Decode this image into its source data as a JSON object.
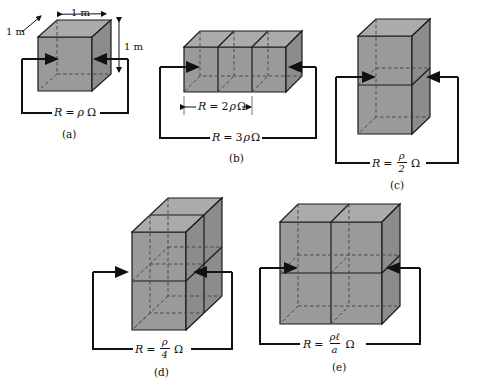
{
  "figure": {
    "type": "physics-diagram",
    "colors": {
      "face_front": "#9a9a9a",
      "face_top": "#ababab",
      "face_side": "#8c8c8c",
      "edge": "#1a1a1a",
      "hidden_edge": "#4a4a4a",
      "wire": "#111111",
      "background": "#ffffff"
    }
  },
  "panels": [
    {
      "id": "a",
      "caption": "(a)",
      "formula_plain": "R = ρΩ",
      "formula": {
        "lhs": "R",
        "eq": "=",
        "rho": "ρ",
        "ohm": "Ω"
      },
      "arrangement": "1 cube",
      "dimensions": [
        {
          "name": "depth",
          "label": "1 m"
        },
        {
          "name": "width",
          "label": "1 m"
        },
        {
          "name": "height",
          "label": "1 m"
        }
      ]
    },
    {
      "id": "b",
      "caption": "(b)",
      "formula_plain": "R = 3ρΩ",
      "formula": {
        "lhs": "R",
        "eq": "=",
        "coeff": "3",
        "rho": "ρ",
        "ohm": "Ω"
      },
      "inner_formula_plain": "R = 2ρΩ",
      "inner_formula": {
        "lhs": "R",
        "eq": "=",
        "coeff": "2",
        "rho": "ρ",
        "ohm": "Ω"
      },
      "arrangement": "3 cubes in a row"
    },
    {
      "id": "c",
      "caption": "(c)",
      "formula_plain": "R = ρ/2 Ω",
      "formula": {
        "lhs": "R",
        "eq": "=",
        "num": "ρ",
        "den": "2",
        "ohm": "Ω"
      },
      "arrangement": "2 cubes stacked vertically"
    },
    {
      "id": "d",
      "caption": "(d)",
      "formula_plain": "R = ρ/4 Ω",
      "formula": {
        "lhs": "R",
        "eq": "=",
        "num": "ρ",
        "den": "4",
        "ohm": "Ω"
      },
      "arrangement": "4 cubes, 2 high by 2 deep"
    },
    {
      "id": "e",
      "caption": "(e)",
      "formula_plain": "R = ρℓ/a Ω",
      "formula": {
        "lhs": "R",
        "eq": "=",
        "num": "ρℓ",
        "den": "a",
        "ohm": "Ω"
      },
      "arrangement": "4 cubes, 2 wide by 2 high"
    }
  ]
}
